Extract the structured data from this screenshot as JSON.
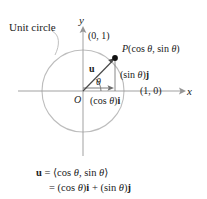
{
  "figure": {
    "type": "unit-circle-vector-diagram",
    "background_color": "#ffffff",
    "axis_color": "#8c8c8c",
    "circle_color": "#b5b5b5",
    "vector_color": "#4a4a4a",
    "text_color": "#1a1a1a"
  },
  "annotations": {
    "unit_circle_label": "Unit circle",
    "y_axis_label": "y",
    "x_axis_label": "x",
    "origin_label": "O",
    "point_top": "(0, 1)",
    "point_right": "(1, 0)",
    "point_p_prefix": "P",
    "point_p_paren_open": "(",
    "point_p_cos": "cos ",
    "point_p_theta": "θ",
    "point_p_comma": ", ",
    "point_p_sin": "sin ",
    "point_p_paren_close": ")",
    "vector_u": "u",
    "theta": "θ",
    "sin_component_open": "(sin ",
    "sin_component_close": ")",
    "sin_component_unit": "j",
    "cos_component_open": "(cos ",
    "cos_component_close": ")",
    "cos_component_unit": "i"
  },
  "equation": {
    "line1": {
      "lhs": "u",
      "eq": " = ",
      "rhs_open": "⟨cos ",
      "rhs_theta1": "θ",
      "rhs_comma": ", sin ",
      "rhs_theta2": "θ",
      "rhs_close": "⟩"
    },
    "line2": {
      "eq": "= ",
      "t1_open": "(cos ",
      "t1_theta": "θ",
      "t1_close": ")",
      "t1_unit": "i",
      "plus": " + ",
      "t2_open": "(sin ",
      "t2_theta": "θ",
      "t2_close": ")",
      "t2_unit": "j"
    }
  },
  "geometry": {
    "origin_px": [
      83,
      91
    ],
    "radius_px": 41,
    "point_p_px": [
      115,
      58
    ],
    "angle_degrees": 46,
    "x_axis_span_px": [
      18,
      186
    ],
    "y_axis_span_px": [
      26,
      156
    ]
  }
}
